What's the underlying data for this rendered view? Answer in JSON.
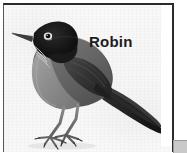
{
  "image": {
    "subject_label": "Robin",
    "alt_description": "Grayscale photograph of an American Robin standing in profile facing left",
    "background_color": "#f8f8f8",
    "frame_border_color": "#2b2b2b",
    "caption_color": "#1d1d1d"
  },
  "bird": {
    "name": "Robin",
    "head_color": "#151515",
    "back_color": "#6e6e6e",
    "wing_color": "#3a3a3a",
    "breast_color": "#949494",
    "tail_color": "#222222",
    "leg_color": "#7a7a7a",
    "beak_color": "#4a4a4a",
    "eye_ring_color": "#f2f2f2"
  },
  "corner": {
    "widget_color": "#c9c9c9",
    "widget_label": ""
  }
}
